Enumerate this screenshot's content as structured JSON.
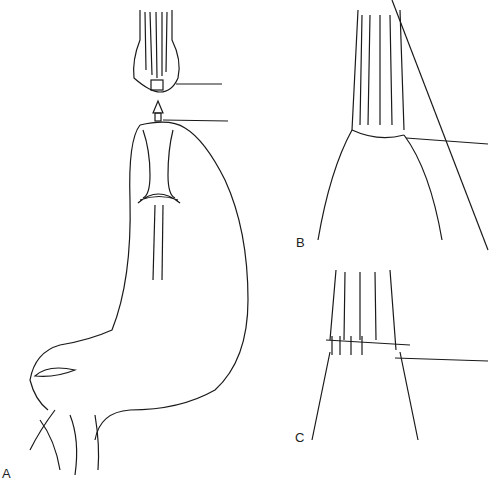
{
  "figure": {
    "panels": [
      {
        "id": "A",
        "label": "A",
        "description": "Circular stapler anvil and spike approaching stomach conduit"
      },
      {
        "id": "B",
        "label": "B",
        "description": "Completed stapled anastomosis"
      },
      {
        "id": "C",
        "label": "C",
        "description": "Hand-sewn anastomosis with interrupted sutures"
      }
    ],
    "colors": {
      "ink": "#1a1a1a",
      "background": "#ffffff"
    }
  }
}
